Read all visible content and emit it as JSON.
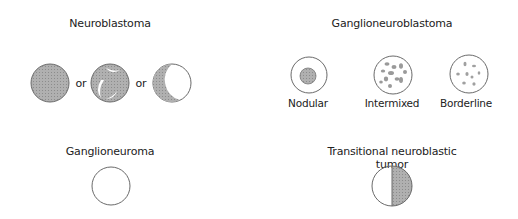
{
  "colors": {
    "stroke": "#777777",
    "fill": "#a8a8a8",
    "fill_dark": "#999999",
    "background": "#ffffff"
  },
  "panels": {
    "neuroblastoma": {
      "title": "Neuroblastoma",
      "connector": "or"
    },
    "ganglioneuroblastoma": {
      "title": "Ganglioneuroblastoma",
      "subtypes": [
        {
          "label": "Nodular"
        },
        {
          "label": "Intermixed"
        },
        {
          "label": "Borderline"
        }
      ]
    },
    "ganglioneuroma": {
      "title": "Ganglioneuroma"
    },
    "transitional": {
      "title_line1": "Transitional neuroblastic",
      "title_line2": "tumor"
    }
  }
}
